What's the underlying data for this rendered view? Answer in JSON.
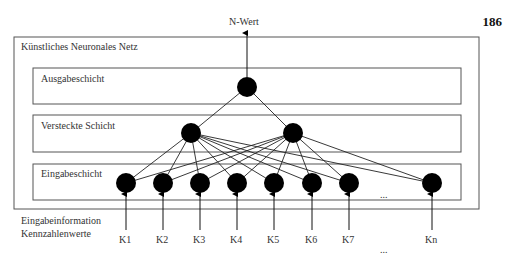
{
  "page_number": "186",
  "output_label": "N-Wert",
  "network_title": "Künstliches Neuronales Netz",
  "layers": {
    "output": {
      "label": "Ausgabeschicht",
      "node_count": 1
    },
    "hidden": {
      "label": "Versteckte Schicht",
      "node_count": 2
    },
    "input": {
      "label": "Eingabeschicht",
      "node_count": 8,
      "ellipsis": "..."
    }
  },
  "input_info": {
    "line1": "Eingabeinformation",
    "line2": "Kennzahlenwerte"
  },
  "input_labels": [
    "K1",
    "K2",
    "K3",
    "K4",
    "K5",
    "K6",
    "K7",
    "Kn"
  ],
  "bottom_ellipsis": "...",
  "colors": {
    "node": "#000000",
    "line": "#222222",
    "box": "#555555"
  }
}
